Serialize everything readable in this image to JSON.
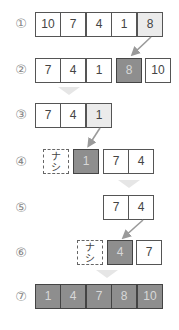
{
  "diagram": {
    "title": "",
    "colors": {
      "plain": "#ffffff",
      "highlight": "#ebebeb",
      "sorted": "#8e8e8e",
      "border": "#555555",
      "arrow": "#9a9a9a"
    },
    "steps": [
      {
        "label": "①",
        "cells": [
          {
            "v": "10",
            "s": "plain"
          },
          {
            "v": "7",
            "s": "plain"
          },
          {
            "v": "4",
            "s": "plain"
          },
          {
            "v": "1",
            "s": "plain"
          },
          {
            "v": "8",
            "s": "light"
          }
        ]
      },
      {
        "label": "②",
        "cells": [
          {
            "v": "7",
            "s": "plain"
          },
          {
            "v": "4",
            "s": "plain"
          },
          {
            "v": "1",
            "s": "plain"
          },
          {
            "v": "8",
            "s": "dark"
          },
          {
            "v": "10",
            "s": "plain"
          }
        ]
      },
      {
        "label": "③",
        "cells": [
          {
            "v": "7",
            "s": "plain"
          },
          {
            "v": "4",
            "s": "plain"
          },
          {
            "v": "1",
            "s": "light"
          }
        ]
      },
      {
        "label": "④",
        "cells": [
          {
            "v": "ナ シ",
            "s": "none"
          },
          {
            "v": "1",
            "s": "dark"
          },
          {
            "v": "7",
            "s": "plain"
          },
          {
            "v": "4",
            "s": "plain"
          }
        ]
      },
      {
        "label": "⑤",
        "cells": [
          {
            "v": "7",
            "s": "plain"
          },
          {
            "v": "4",
            "s": "plain"
          }
        ]
      },
      {
        "label": "⑥",
        "cells": [
          {
            "v": "ナ シ",
            "s": "none"
          },
          {
            "v": "4",
            "s": "dark"
          },
          {
            "v": "7",
            "s": "plain"
          }
        ]
      },
      {
        "label": "⑦",
        "cells": [
          {
            "v": "1",
            "s": "dark"
          },
          {
            "v": "4",
            "s": "dark"
          },
          {
            "v": "7",
            "s": "dark"
          },
          {
            "v": "8",
            "s": "dark"
          },
          {
            "v": "10",
            "s": "dark"
          }
        ]
      }
    ],
    "none_label_top": "ナ",
    "none_label_bottom": "シ"
  }
}
